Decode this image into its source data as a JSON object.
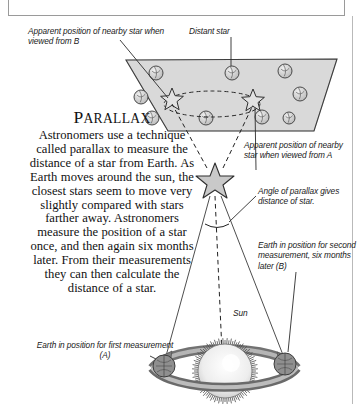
{
  "figure": {
    "title_first": "P",
    "title_rest": "ARALLAX",
    "body": "Astronomers use a technique called parallax to measure the distance of a star from Earth. As Earth moves around the sun, the closest stars seem to move very slightly compared with stars farther away. Astronomers measure the position of a star once, and then again six months later. From their measurements they can then calculate the distance of a star."
  },
  "labels": {
    "apparent_b": "Apparent position of nearby star when viewed from B",
    "distant_star": "Distant star",
    "apparent_a": "Apparent position of nearby star when viewed from A",
    "angle": "Angle of parallax gives distance of star.",
    "earth_b": "Earth in position for second measurement, six months later (B)",
    "sun": "Sun",
    "earth_a": "Earth in position for first measurement (A)"
  },
  "colors": {
    "ink": "#1a1a1a",
    "sky_fill": "#d9d9d9",
    "sky_stroke": "#3a3a3a",
    "star_fill": "#c9c9c9",
    "orbit_fill": "#b5b5b5",
    "sun_fill": "#e8e8e8",
    "earth_fill": "#8d8d8d",
    "frame": "#9a9a9a"
  },
  "sky_stars": [
    {
      "cx": 156,
      "cy": 73,
      "r": 7
    },
    {
      "cx": 232,
      "cy": 73,
      "r": 7
    },
    {
      "cx": 285,
      "cy": 71,
      "r": 7
    },
    {
      "cx": 141,
      "cy": 97,
      "r": 7
    },
    {
      "cx": 300,
      "cy": 94,
      "r": 7
    },
    {
      "cx": 152,
      "cy": 118,
      "r": 7
    },
    {
      "cx": 206,
      "cy": 118,
      "r": 7
    },
    {
      "cx": 262,
      "cy": 117,
      "r": 7
    },
    {
      "cx": 289,
      "cy": 118,
      "r": 6
    }
  ],
  "apparent_stars": [
    {
      "cx": 172,
      "cy": 100,
      "r": 12,
      "name": "apparent-star-from-b"
    },
    {
      "cx": 253,
      "cy": 101,
      "r": 12,
      "name": "apparent-star-from-a"
    }
  ],
  "nearby_star": {
    "cx": 215,
    "cy": 181,
    "r": 16
  },
  "earth_a_marker": {
    "cx": 164,
    "cy": 366
  },
  "earth_b_marker": {
    "cx": 285,
    "cy": 364
  },
  "sun_marker": {
    "cx": 225,
    "cy": 371,
    "r": 25
  }
}
